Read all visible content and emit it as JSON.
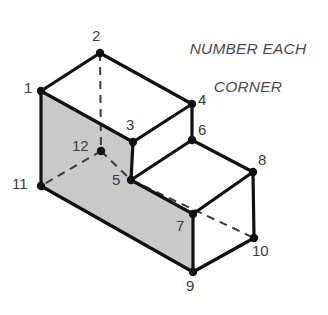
{
  "figure": {
    "title_lines": "NUMBER EACH\nCORNER",
    "title_line_1": "NUMBER EACH",
    "title_line_2": "CORNER",
    "canvas": {
      "width": 328,
      "height": 315
    },
    "colors": {
      "background": "#ffffff",
      "stroke": "#111111",
      "shaded_face_fill": "#c9c9c9",
      "unshaded_face_fill": "#ffffff",
      "label_text": "#3b3b3b",
      "title_text": "#4a4a4a",
      "vertex_dot": "#111111",
      "hidden_edge": "#3a3a3a"
    },
    "stroke_widths": {
      "visible_edge": 3.2,
      "hidden_edge": 2.0
    },
    "vertex_dot_radius": 4.2,
    "vertices": [
      {
        "id": "1",
        "label": "1",
        "x": 41,
        "y": 91,
        "label_x": 24,
        "label_y": 80,
        "visible": true
      },
      {
        "id": "2",
        "label": "2",
        "x": 100,
        "y": 53,
        "label_x": 92,
        "label_y": 28,
        "visible": true
      },
      {
        "id": "3",
        "label": "3",
        "x": 133,
        "y": 142,
        "label_x": 126,
        "label_y": 117,
        "visible": true
      },
      {
        "id": "4",
        "label": "4",
        "x": 192,
        "y": 104,
        "label_x": 198,
        "label_y": 92,
        "visible": true
      },
      {
        "id": "5",
        "label": "5",
        "x": 131,
        "y": 180,
        "label_x": 112,
        "label_y": 172,
        "visible": true
      },
      {
        "id": "6",
        "label": "6",
        "x": 192,
        "y": 140,
        "label_x": 198,
        "label_y": 122,
        "visible": true
      },
      {
        "id": "7",
        "label": "7",
        "x": 193,
        "y": 214,
        "label_x": 176,
        "label_y": 218,
        "visible": true
      },
      {
        "id": "8",
        "label": "8",
        "x": 253,
        "y": 172,
        "label_x": 258,
        "label_y": 152,
        "visible": true
      },
      {
        "id": "9",
        "label": "9",
        "x": 193,
        "y": 272,
        "label_x": 186,
        "label_y": 278,
        "visible": true
      },
      {
        "id": "10",
        "label": "10",
        "x": 254,
        "y": 238,
        "label_x": 252,
        "label_y": 243,
        "visible": true
      },
      {
        "id": "11",
        "label": "11",
        "x": 41,
        "y": 186,
        "label_x": 12,
        "label_y": 176,
        "visible": true
      },
      {
        "id": "12",
        "label": "12",
        "x": 101,
        "y": 151,
        "label_x": 72,
        "label_y": 138,
        "visible": false
      }
    ],
    "faces": [
      {
        "name": "front-left-shaded-face",
        "points": "41,91 133,142 131,180 193,214 193,272 41,186",
        "fill": "#c9c9c9",
        "shaded": true
      },
      {
        "name": "top-left-face",
        "points": "41,91 100,53 192,104 133,142",
        "fill": "#ffffff",
        "shaded": false
      },
      {
        "name": "step-tread-face",
        "points": "131,180 192,140 253,172 193,214",
        "fill": "#ffffff",
        "shaded": false
      },
      {
        "name": "right-end-face",
        "points": "193,214 253,172 254,238 193,272",
        "fill": "#ffffff",
        "shaded": false
      },
      {
        "name": "step-riser-face",
        "points": "133,142 192,104 192,140 131,180",
        "fill": "#ffffff",
        "shaded": false
      }
    ],
    "visible_edges": [
      {
        "name": "edge-1-2",
        "x1": 41,
        "y1": 91,
        "x2": 100,
        "y2": 53
      },
      {
        "name": "edge-2-4",
        "x1": 100,
        "y1": 53,
        "x2": 192,
        "y2": 104
      },
      {
        "name": "edge-4-3",
        "x1": 192,
        "y1": 104,
        "x2": 133,
        "y2": 142
      },
      {
        "name": "edge-3-1",
        "x1": 133,
        "y1": 142,
        "x2": 41,
        "y2": 91
      },
      {
        "name": "edge-1-11",
        "x1": 41,
        "y1": 91,
        "x2": 41,
        "y2": 186
      },
      {
        "name": "edge-3-5",
        "x1": 133,
        "y1": 142,
        "x2": 131,
        "y2": 180
      },
      {
        "name": "edge-4-6",
        "x1": 192,
        "y1": 104,
        "x2": 192,
        "y2": 140
      },
      {
        "name": "edge-11-9",
        "x1": 41,
        "y1": 186,
        "x2": 193,
        "y2": 272
      },
      {
        "name": "edge-5-6",
        "x1": 131,
        "y1": 180,
        "x2": 192,
        "y2": 140
      },
      {
        "name": "edge-6-8",
        "x1": 192,
        "y1": 140,
        "x2": 253,
        "y2": 172
      },
      {
        "name": "edge-5-7",
        "x1": 131,
        "y1": 180,
        "x2": 193,
        "y2": 214
      },
      {
        "name": "edge-7-8",
        "x1": 193,
        "y1": 214,
        "x2": 253,
        "y2": 172
      },
      {
        "name": "edge-8-10",
        "x1": 253,
        "y1": 172,
        "x2": 254,
        "y2": 238
      },
      {
        "name": "edge-7-9",
        "x1": 193,
        "y1": 214,
        "x2": 193,
        "y2": 272
      },
      {
        "name": "edge-9-10",
        "x1": 193,
        "y1": 272,
        "x2": 254,
        "y2": 238
      }
    ],
    "hidden_edges": [
      {
        "name": "hidden-edge-2-12",
        "x1": 100,
        "y1": 53,
        "x2": 101,
        "y2": 151
      },
      {
        "name": "hidden-edge-12-11",
        "x1": 101,
        "y1": 151,
        "x2": 41,
        "y2": 186
      },
      {
        "name": "hidden-edge-12-5",
        "x1": 101,
        "y1": 151,
        "x2": 131,
        "y2": 180
      },
      {
        "name": "hidden-edge-5-10",
        "x1": 131,
        "y1": 180,
        "x2": 254,
        "y2": 238
      }
    ]
  }
}
